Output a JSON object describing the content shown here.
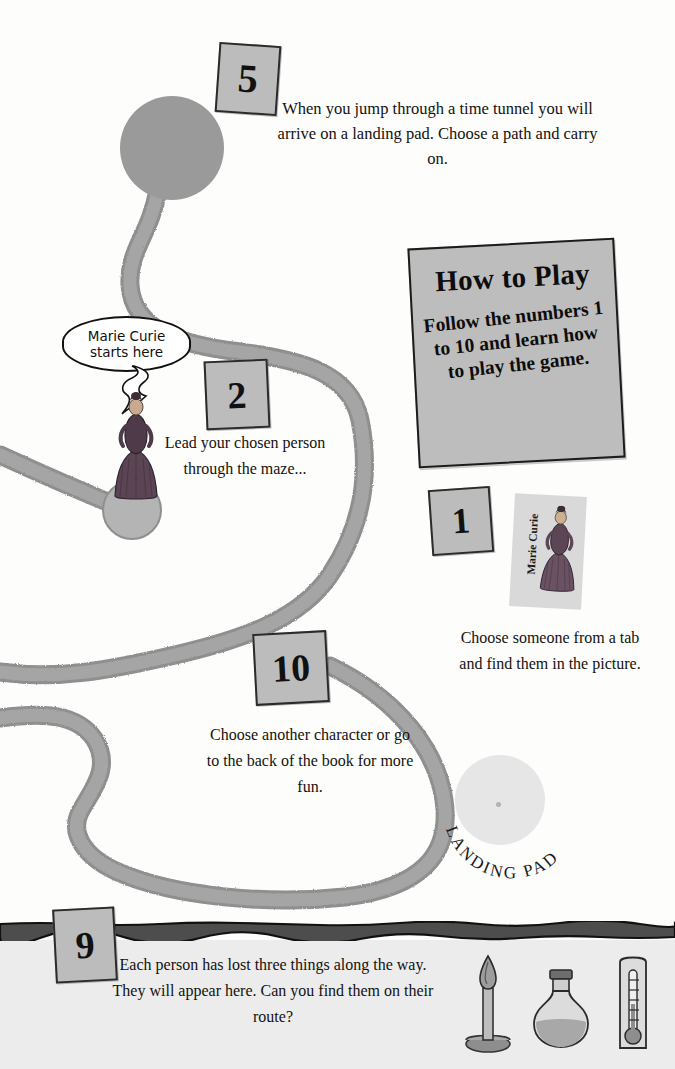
{
  "page": {
    "background_color": "#fdfdfc",
    "path_color": "#9a9a9a",
    "tile_color": "#bcbcbc",
    "band_color": "#4a4a4a",
    "bottom_panel_color": "#ececec"
  },
  "how_to_play": {
    "title": "How to Play",
    "body": "Follow the numbers 1 to 10 and learn how to play the game."
  },
  "speech_bubble": {
    "line1": "Marie Curie",
    "line2": "starts here"
  },
  "steps": [
    {
      "number": "1",
      "text": "Choose someone from a tab and find them in the picture."
    },
    {
      "number": "2",
      "text": "Lead your chosen person through the maze..."
    },
    {
      "number": "5",
      "text": "When you jump through a time tunnel you will arrive on a landing pad. Choose a path and carry on."
    },
    {
      "number": "9",
      "text": "Each person has lost three things along the way. They will appear here. Can you find them on their route?"
    },
    {
      "number": "10",
      "text": "Choose another character or go to the back of the book for more fun."
    }
  ],
  "tab_card": {
    "label": "Marie Curie",
    "icon": "victorian-woman-figure"
  },
  "landing_pad": {
    "label": "LANDING PAD",
    "letters": [
      "L",
      "A",
      "N",
      "D",
      "I",
      "N",
      "G",
      " ",
      "P",
      "A",
      "D"
    ]
  },
  "character": {
    "name": "Marie Curie",
    "icon": "victorian-woman-figure"
  },
  "lost_items": [
    {
      "name": "candle-icon",
      "label": "candle"
    },
    {
      "name": "flask-icon",
      "label": "flask"
    },
    {
      "name": "thermometer-icon",
      "label": "thermometer"
    }
  ],
  "time_tunnel": {
    "name": "time-tunnel-circle"
  }
}
